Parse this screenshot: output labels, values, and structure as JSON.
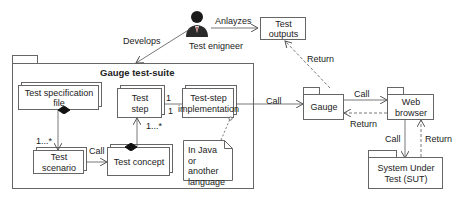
{
  "actor": {
    "label": "Test enigneer",
    "icon": "person-icon"
  },
  "relations": {
    "develops": "Develops",
    "analyzes": "Anlayzes",
    "return_outputs": "Return",
    "call_impl_gauge": "Call",
    "call_gauge_browser": "Call",
    "return_browser_gauge": "Return",
    "call_browser_sut": "Call",
    "return_sut_browser": "Return",
    "call_scenario_concept": "Call"
  },
  "multiplicities": {
    "spec_scenario": "1...*",
    "concept_step": "1...*",
    "step_impl_top": "1",
    "step_impl_bottom": "1"
  },
  "package": {
    "title": "Gauge test-suite"
  },
  "nodes": {
    "test_outputs": "Test outputs",
    "test_spec_file": "Test specification file",
    "test_step": "Test step",
    "test_step_impl": "Test-step implementation",
    "test_scenario": "Test scenario",
    "test_concept": "Test concept",
    "note": "In Java or another language",
    "gauge": "Gauge",
    "web_browser": "Web browser",
    "sut": "System Under Test (SUT)"
  },
  "colors": {
    "line": "#555555",
    "box_border": "#666666",
    "text": "#222222"
  }
}
